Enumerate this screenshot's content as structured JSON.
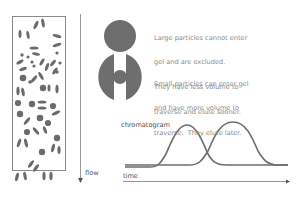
{
  "diagram": {
    "column": {
      "label": "flow",
      "arrow": "down-arrow"
    },
    "bead_illustration": {
      "large_particle": "large-particle",
      "small_particle": "small-particle",
      "gel_bead": "porous-gel-bead"
    },
    "notes": {
      "large": [
        "Large particles cannot enter",
        "gel and are excluded.",
        "They have less volume to",
        "traverse and elute sooner."
      ],
      "small": [
        "Small particles can enter gel",
        "and have more volume to",
        "traverse.  They elute later."
      ]
    },
    "chromatogram": {
      "label": "chromatogram",
      "x_axis_label": "time",
      "peaks": [
        "large-particle-peak",
        "small-particle-peak"
      ]
    },
    "colors": {
      "particle": "#6e6e6e",
      "line": "#6e6e6e",
      "border": "#777777",
      "text": "#8a8a8a"
    }
  }
}
